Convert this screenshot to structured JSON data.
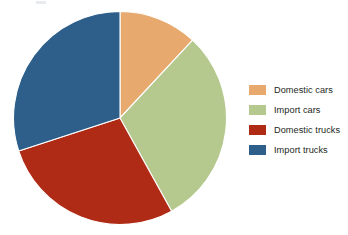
{
  "chart_data": {
    "type": "pie",
    "title": "",
    "subtitle": "",
    "xlabel": "",
    "ylabel": "",
    "grid": false,
    "legend_position": "right",
    "start_angle_deg": 0,
    "direction": "clockwise",
    "categories": [
      "Domestic cars",
      "Import cars",
      "Domestic trucks",
      "Import trucks"
    ],
    "values": [
      12,
      30,
      28,
      30
    ],
    "value_unit": "percent",
    "slices": [
      {
        "label": "Domestic cars",
        "value": 12,
        "percent": "12%",
        "color": "#e8a96e",
        "start_angle_deg": 0,
        "end_angle_deg": 43
      },
      {
        "label": "Import cars",
        "value": 30,
        "percent": "30%",
        "color": "#b5c98e",
        "start_angle_deg": 43,
        "end_angle_deg": 151
      },
      {
        "label": "Domestic trucks",
        "value": 28,
        "percent": "28%",
        "color": "#b02b16",
        "start_angle_deg": 151,
        "end_angle_deg": 252
      },
      {
        "label": "Import trucks",
        "value": 30,
        "percent": "30%",
        "color": "#2d5f8a",
        "start_angle_deg": 252,
        "end_angle_deg": 360
      }
    ]
  },
  "legend": {
    "items": [
      {
        "label": "Domestic cars",
        "color": "#e8a96e"
      },
      {
        "label": "Import cars",
        "color": "#b5c98e"
      },
      {
        "label": "Domestic trucks",
        "color": "#b02b16"
      },
      {
        "label": "Import trucks",
        "color": "#2d5f8a"
      }
    ]
  },
  "colors": {
    "domestic_cars": "#e8a96e",
    "import_cars": "#b5c98e",
    "domestic_trucks": "#b02b16",
    "import_trucks": "#2d5f8a",
    "background": "#ffffff",
    "text": "#231f20"
  }
}
